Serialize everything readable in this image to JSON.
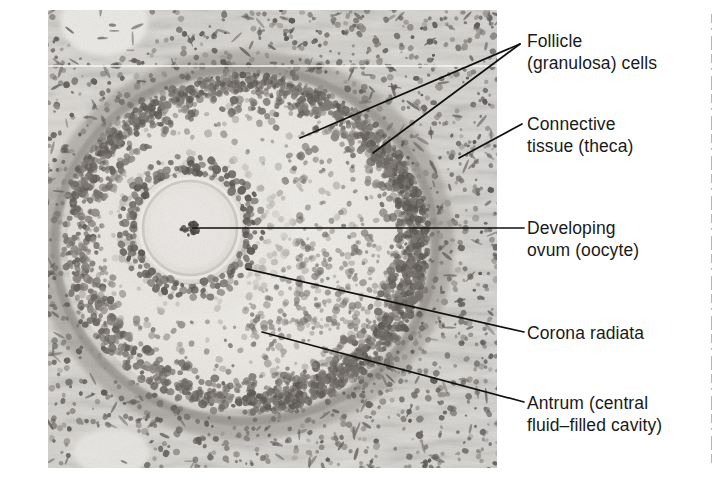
{
  "figure": {
    "type": "histology-micrograph-with-labels",
    "image_region": {
      "x": 48,
      "y": 10,
      "width": 449,
      "height": 458
    },
    "palette": {
      "background": "#ffffff",
      "text": "#1a1a1a",
      "leader_line": "#111111",
      "tissue_light": "#e8e6e2",
      "tissue_mid": "#b9b5ae",
      "tissue_dark": "#6f6b66",
      "nucleus": "#575350",
      "divider": "#b0b0b0"
    }
  },
  "labels": [
    {
      "id": "follicle-granulosa-cells",
      "name": "follicle-granulosa-cells-label",
      "line1": "Follicle",
      "line2": "(granulosa) cells",
      "x": 527,
      "y": 38,
      "leaders": [
        {
          "x1": 300,
          "y1": 138,
          "x2": 520,
          "y2": 44
        },
        {
          "x1": 373,
          "y1": 153,
          "x2": 520,
          "y2": 44
        }
      ]
    },
    {
      "id": "connective-tissue-theca",
      "name": "connective-tissue-label",
      "line1": "Connective",
      "line2": "tissue (theca)",
      "x": 527,
      "y": 116,
      "leaders": [
        {
          "x1": 459,
          "y1": 158,
          "x2": 522,
          "y2": 124
        }
      ]
    },
    {
      "id": "developing-ovum-oocyte",
      "name": "developing-ovum-label",
      "line1": "Developing",
      "line2": "ovum (oocyte)",
      "x": 527,
      "y": 216,
      "leaders": [
        {
          "x1": 193,
          "y1": 228,
          "x2": 524,
          "y2": 228
        }
      ]
    },
    {
      "id": "corona-radiata",
      "name": "corona-radiata-label",
      "line1": "Corona radiata",
      "line2": "",
      "x": 527,
      "y": 324,
      "leaders": [
        {
          "x1": 247,
          "y1": 269,
          "x2": 524,
          "y2": 332
        }
      ]
    },
    {
      "id": "antrum",
      "name": "antrum-label",
      "line1": "Antrum (central",
      "line2": "fluid–filled cavity)",
      "x": 527,
      "y": 392,
      "leaders": [
        {
          "x1": 262,
          "y1": 332,
          "x2": 524,
          "y2": 402
        }
      ]
    }
  ],
  "micrograph_structures": {
    "antrum_ellipse": {
      "cx": 245,
      "cy": 245,
      "rx": 175,
      "ry": 160
    },
    "granulosa_layer": {
      "cx": 245,
      "cy": 245,
      "rx": 178,
      "ry": 163
    },
    "theca_layer": {
      "cx": 245,
      "cy": 245,
      "rx": 196,
      "ry": 182
    },
    "oocyte": {
      "cx": 190,
      "cy": 228,
      "r": 54
    },
    "zona_pellucida": {
      "cx": 190,
      "cy": 228,
      "r": 46
    },
    "nucleus": {
      "cx": 191,
      "cy": 228,
      "r": 9
    },
    "corona_radiata": {
      "cx": 190,
      "cy": 228,
      "r": 60
    },
    "upper_left_void": {
      "cx": 104,
      "cy": 22,
      "rx": 42,
      "ry": 32
    },
    "lower_left_void": {
      "cx": 112,
      "cy": 452,
      "rx": 36,
      "ry": 22
    }
  }
}
